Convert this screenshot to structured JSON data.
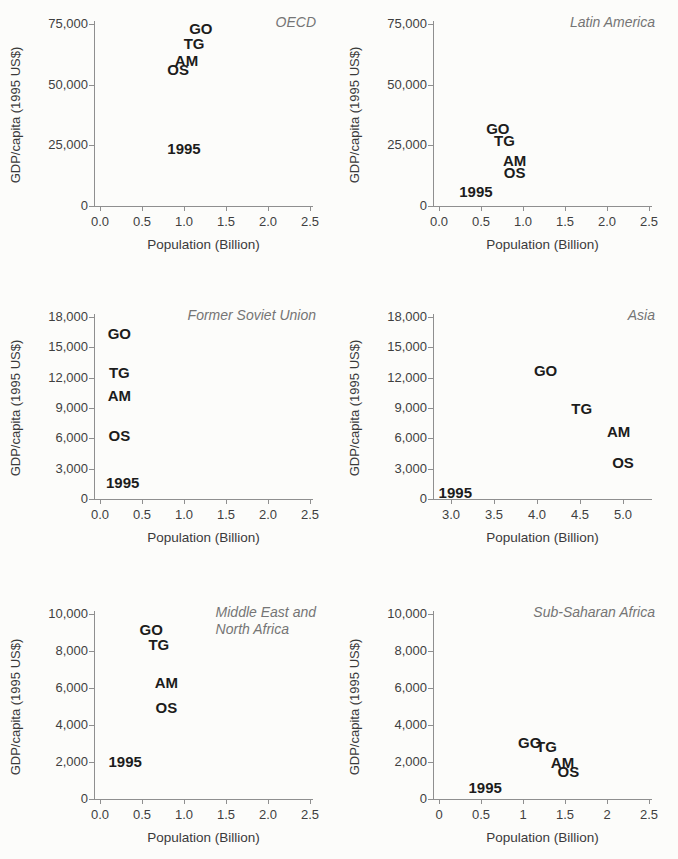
{
  "figure": {
    "xlabel": "Population (Billion)",
    "ylabel": "GDP/capita (1995 US$)"
  },
  "chart_data": [
    {
      "type": "scatter",
      "title": "OECD",
      "xlabel": "Population (Billion)",
      "ylabel": "GDP/capita (1995 US$)",
      "xlim": [
        0,
        2.5
      ],
      "ylim": [
        0,
        75000
      ],
      "xticks": {
        "values": [
          0,
          0.5,
          1.0,
          1.5,
          2.0,
          2.5
        ],
        "labels": [
          "0.0",
          "0.5",
          "1.0",
          "1.5",
          "2.0",
          "2.5"
        ]
      },
      "yticks": {
        "values": [
          0,
          25000,
          50000,
          75000
        ],
        "labels": [
          "0",
          "25,000",
          "50,000",
          "75,000"
        ]
      },
      "points": [
        {
          "label": "GO",
          "x": 1.2,
          "y": 73500
        },
        {
          "label": "TG",
          "x": 1.12,
          "y": 67000
        },
        {
          "label": "AM",
          "x": 1.03,
          "y": 60000
        },
        {
          "label": "OS",
          "x": 0.93,
          "y": 56500
        },
        {
          "label": "1995",
          "x": 1.0,
          "y": 24000
        }
      ]
    },
    {
      "type": "scatter",
      "title": "Latin America",
      "xlabel": "Population (Billion)",
      "ylabel": "GDP/capita (1995 US$)",
      "xlim": [
        0,
        2.5
      ],
      "ylim": [
        0,
        75000
      ],
      "xticks": {
        "values": [
          0,
          0.5,
          1.0,
          1.5,
          2.0,
          2.5
        ],
        "labels": [
          "0.0",
          "0.5",
          "1.0",
          "1.5",
          "2.0",
          "2.5"
        ]
      },
      "yticks": {
        "values": [
          0,
          25000,
          50000,
          75000
        ],
        "labels": [
          "0",
          "25,000",
          "50,000",
          "75,000"
        ]
      },
      "points": [
        {
          "label": "GO",
          "x": 0.7,
          "y": 32000
        },
        {
          "label": "TG",
          "x": 0.78,
          "y": 27000
        },
        {
          "label": "AM",
          "x": 0.9,
          "y": 19000
        },
        {
          "label": "OS",
          "x": 0.9,
          "y": 14000
        },
        {
          "label": "1995",
          "x": 0.44,
          "y": 6000
        }
      ]
    },
    {
      "type": "scatter",
      "title": "Former Soviet Union",
      "xlabel": "Population (Billion)",
      "ylabel": "GDP/capita (1995 US$)",
      "xlim": [
        0,
        2.5
      ],
      "ylim": [
        0,
        18000
      ],
      "xticks": {
        "values": [
          0,
          0.5,
          1.0,
          1.5,
          2.0,
          2.5
        ],
        "labels": [
          "0.0",
          "0.5",
          "1.0",
          "1.5",
          "2.0",
          "2.5"
        ]
      },
      "yticks": {
        "values": [
          0,
          3000,
          6000,
          9000,
          12000,
          15000,
          18000
        ],
        "labels": [
          "0",
          "3,000",
          "6,000",
          "9,000",
          "12,000",
          "15,000",
          "18,000"
        ]
      },
      "points": [
        {
          "label": "GO",
          "x": 0.23,
          "y": 16400
        },
        {
          "label": "TG",
          "x": 0.23,
          "y": 12600
        },
        {
          "label": "AM",
          "x": 0.23,
          "y": 10300
        },
        {
          "label": "OS",
          "x": 0.23,
          "y": 6300
        },
        {
          "label": "1995",
          "x": 0.27,
          "y": 1700
        }
      ]
    },
    {
      "type": "scatter",
      "title": "Asia",
      "xlabel": "Population (Billion)",
      "ylabel": "GDP/capita (1995 US$)",
      "xlim": [
        3.0,
        5.0
      ],
      "ylim": [
        0,
        18000
      ],
      "xticks": {
        "values": [
          3.0,
          3.5,
          4.0,
          4.5,
          5.0
        ],
        "labels": [
          "3.0",
          "3.5",
          "4.0",
          "4.5",
          "5.0"
        ]
      },
      "yticks": {
        "values": [
          0,
          3000,
          6000,
          9000,
          12000,
          15000,
          18000
        ],
        "labels": [
          "0",
          "3,000",
          "6,000",
          "9,000",
          "12,000",
          "15,000",
          "18,000"
        ]
      },
      "points": [
        {
          "label": "GO",
          "x": 4.1,
          "y": 12800
        },
        {
          "label": "TG",
          "x": 4.52,
          "y": 9000
        },
        {
          "label": "AM",
          "x": 4.95,
          "y": 6700
        },
        {
          "label": "OS",
          "x": 5.0,
          "y": 3650
        },
        {
          "label": "1995",
          "x": 3.05,
          "y": 700
        }
      ]
    },
    {
      "type": "scatter",
      "title": "Middle East and\nNorth Africa",
      "xlabel": "Population (Billion)",
      "ylabel": "GDP/capita (1995 US$)",
      "xlim": [
        0,
        2.5
      ],
      "ylim": [
        0,
        10000
      ],
      "xticks": {
        "values": [
          0,
          0.5,
          1.0,
          1.5,
          2.0,
          2.5
        ],
        "labels": [
          "0.0",
          "0.5",
          "1.0",
          "1.5",
          "2.0",
          "2.5"
        ]
      },
      "yticks": {
        "values": [
          0,
          2000,
          4000,
          6000,
          8000,
          10000
        ],
        "labels": [
          "0",
          "2,000",
          "4,000",
          "6,000",
          "8,000",
          "10,000"
        ]
      },
      "points": [
        {
          "label": "GO",
          "x": 0.61,
          "y": 9200
        },
        {
          "label": "TG",
          "x": 0.7,
          "y": 8400
        },
        {
          "label": "AM",
          "x": 0.79,
          "y": 6300
        },
        {
          "label": "OS",
          "x": 0.79,
          "y": 5000
        },
        {
          "label": "1995",
          "x": 0.3,
          "y": 2050
        }
      ]
    },
    {
      "type": "scatter",
      "title": "Sub-Saharan Africa",
      "xlabel": "Population (Billion)",
      "ylabel": "GDP/capita (1995 US$)",
      "xlim": [
        0,
        2.5
      ],
      "ylim": [
        0,
        10000
      ],
      "xticks": {
        "values": [
          0,
          0.5,
          1.0,
          1.5,
          2.0,
          2.5
        ],
        "labels": [
          "0",
          "0.5",
          "1",
          "1.5",
          "2",
          "2.5"
        ]
      },
      "yticks": {
        "values": [
          0,
          2000,
          4000,
          6000,
          8000,
          10000
        ],
        "labels": [
          "0",
          "2,000",
          "4,000",
          "6,000",
          "8,000",
          "10,000"
        ]
      },
      "points": [
        {
          "label": "GO",
          "x": 1.08,
          "y": 3100
        },
        {
          "label": "TG",
          "x": 1.28,
          "y": 2850
        },
        {
          "label": "AM",
          "x": 1.47,
          "y": 2000
        },
        {
          "label": "OS",
          "x": 1.54,
          "y": 1500
        },
        {
          "label": "1995",
          "x": 0.55,
          "y": 650
        }
      ]
    }
  ]
}
